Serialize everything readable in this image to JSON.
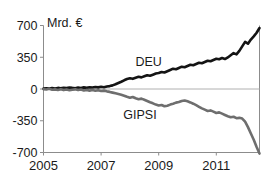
{
  "chart_data": {
    "type": "line",
    "title": "",
    "subtitle": "",
    "unit_label": "Mrd. €",
    "xlabel": "",
    "ylabel": "",
    "ylim": [
      -700,
      700
    ],
    "xlim": [
      2005.0,
      2012.5
    ],
    "yticks": [
      700,
      350,
      0,
      -350,
      -700
    ],
    "ytick_labels": [
      "700",
      "350",
      "0",
      "-350",
      "-700"
    ],
    "xticks": [
      2005,
      2007,
      2009,
      2011
    ],
    "xtick_labels": [
      "2005",
      "2007",
      "2009",
      "2011"
    ],
    "grid": false,
    "zero_line": true,
    "legend": "inline-labels",
    "colors": {
      "deu": "#141414",
      "gipsi": "#6e6e6e",
      "axis": "#8c8c8c",
      "text": "#1a1a1a",
      "background": "#ffffff"
    },
    "series": [
      {
        "name": "DEU",
        "color": "#141414",
        "label_x": 2008.65,
        "label_y": 300,
        "x": [
          2005.0,
          2005.1,
          2005.2,
          2005.3,
          2005.4,
          2005.5,
          2005.6,
          2005.7,
          2005.8,
          2005.9,
          2006.0,
          2006.1,
          2006.2,
          2006.3,
          2006.4,
          2006.5,
          2006.6,
          2006.7,
          2006.8,
          2006.9,
          2007.0,
          2007.1,
          2007.2,
          2007.3,
          2007.4,
          2007.5,
          2007.6,
          2007.7,
          2007.8,
          2007.9,
          2008.0,
          2008.1,
          2008.2,
          2008.3,
          2008.4,
          2008.5,
          2008.6,
          2008.7,
          2008.8,
          2008.9,
          2009.0,
          2009.1,
          2009.2,
          2009.3,
          2009.4,
          2009.5,
          2009.6,
          2009.7,
          2009.8,
          2009.9,
          2010.0,
          2010.1,
          2010.2,
          2010.3,
          2010.4,
          2010.5,
          2010.6,
          2010.7,
          2010.8,
          2010.9,
          2011.0,
          2011.1,
          2011.2,
          2011.3,
          2011.4,
          2011.5,
          2011.6,
          2011.7,
          2011.8,
          2011.9,
          2012.0,
          2012.1,
          2012.2,
          2012.3,
          2012.4,
          2012.5
        ],
        "values": [
          5,
          8,
          4,
          10,
          6,
          12,
          8,
          14,
          10,
          16,
          12,
          9,
          15,
          11,
          18,
          14,
          20,
          16,
          22,
          18,
          24,
          20,
          28,
          32,
          40,
          52,
          66,
          80,
          96,
          110,
          118,
          112,
          124,
          134,
          128,
          140,
          152,
          146,
          158,
          170,
          176,
          188,
          182,
          196,
          210,
          224,
          218,
          232,
          246,
          240,
          254,
          268,
          262,
          276,
          290,
          284,
          298,
          312,
          306,
          320,
          334,
          328,
          342,
          330,
          348,
          372,
          396,
          382,
          420,
          470,
          520,
          500,
          545,
          580,
          620,
          672
        ]
      },
      {
        "name": "GIPSI",
        "color": "#6e6e6e",
        "label_x": 2008.35,
        "label_y": -290,
        "x": [
          2005.0,
          2005.1,
          2005.2,
          2005.3,
          2005.4,
          2005.5,
          2005.6,
          2005.7,
          2005.8,
          2005.9,
          2006.0,
          2006.1,
          2006.2,
          2006.3,
          2006.4,
          2006.5,
          2006.6,
          2006.7,
          2006.8,
          2006.9,
          2007.0,
          2007.1,
          2007.2,
          2007.3,
          2007.4,
          2007.5,
          2007.6,
          2007.7,
          2007.8,
          2007.9,
          2008.0,
          2008.1,
          2008.2,
          2008.3,
          2008.4,
          2008.5,
          2008.6,
          2008.7,
          2008.8,
          2008.9,
          2009.0,
          2009.1,
          2009.2,
          2009.3,
          2009.4,
          2009.5,
          2009.6,
          2009.7,
          2009.8,
          2009.9,
          2010.0,
          2010.1,
          2010.2,
          2010.3,
          2010.4,
          2010.5,
          2010.6,
          2010.7,
          2010.8,
          2010.9,
          2011.0,
          2011.1,
          2011.2,
          2011.3,
          2011.4,
          2011.5,
          2011.6,
          2011.7,
          2011.8,
          2011.9,
          2012.0,
          2012.1,
          2012.2,
          2012.3,
          2012.4,
          2012.5
        ],
        "values": [
          -2,
          -6,
          2,
          -8,
          -4,
          -10,
          -2,
          -12,
          -6,
          -14,
          -8,
          -4,
          -12,
          -6,
          -16,
          -10,
          -18,
          -12,
          -20,
          -14,
          -22,
          -18,
          -26,
          -32,
          -40,
          -48,
          -56,
          -64,
          -74,
          -86,
          -96,
          -88,
          -102,
          -112,
          -106,
          -118,
          -132,
          -146,
          -158,
          -172,
          -182,
          -176,
          -190,
          -184,
          -172,
          -162,
          -150,
          -144,
          -132,
          -126,
          -136,
          -148,
          -162,
          -178,
          -196,
          -214,
          -228,
          -242,
          -236,
          -250,
          -264,
          -258,
          -272,
          -286,
          -300,
          -312,
          -306,
          -322,
          -318,
          -326,
          -360,
          -420,
          -490,
          -560,
          -640,
          -712
        ]
      }
    ]
  }
}
